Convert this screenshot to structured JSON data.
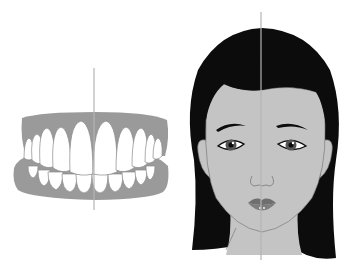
{
  "figure": {
    "panels": [
      {
        "id": "teeth",
        "description": "Frontal view of dental arches with vertical midline",
        "midline_x": 94
      },
      {
        "id": "face",
        "description": "Frontal view of female face with vertical facial midline",
        "midline_x": 81
      }
    ],
    "colors": {
      "gum": "#9a9a9a",
      "tooth": "#ffffff",
      "tooth_outline": "#8a8a8a",
      "midline": "#b5b5b5",
      "hair": "#0c0c0c",
      "skin": "#c4c4c4",
      "skin_outline": "#6e6e6e",
      "lips": "#6f6f6f",
      "iris": "#555555"
    }
  }
}
